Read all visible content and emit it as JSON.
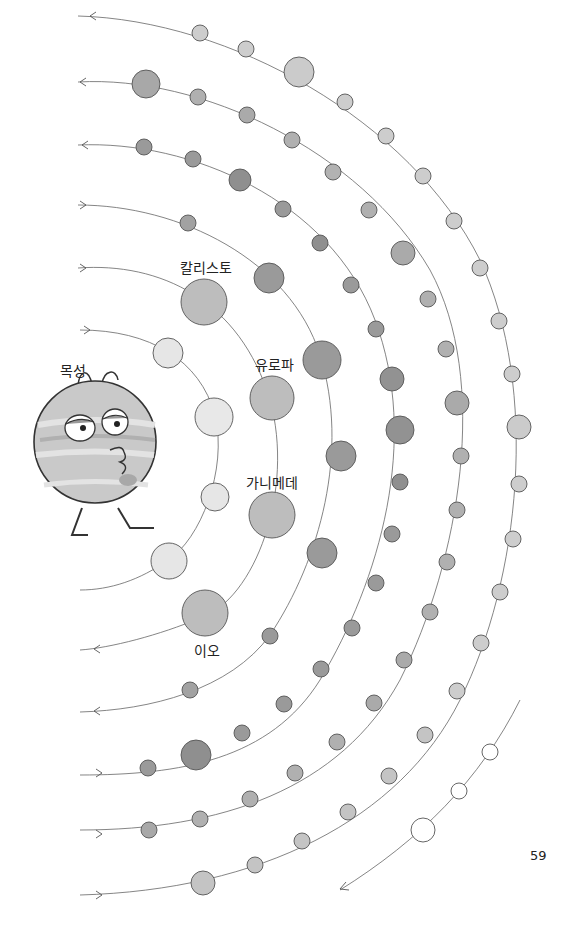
{
  "page": {
    "number": "59"
  },
  "labels": {
    "jupiter": "목성",
    "callisto": "칼리스토",
    "europa": "유로파",
    "ganymede": "가니메데",
    "io": "이오"
  },
  "colors": {
    "inner_moon": "#e6e6e6",
    "galilean": "#bdbdbd",
    "mid_moon": "#9a9a9a",
    "outer_moon": "#c4c4c4",
    "far_moon": "#ffffff",
    "orbit_line": "#666666"
  }
}
